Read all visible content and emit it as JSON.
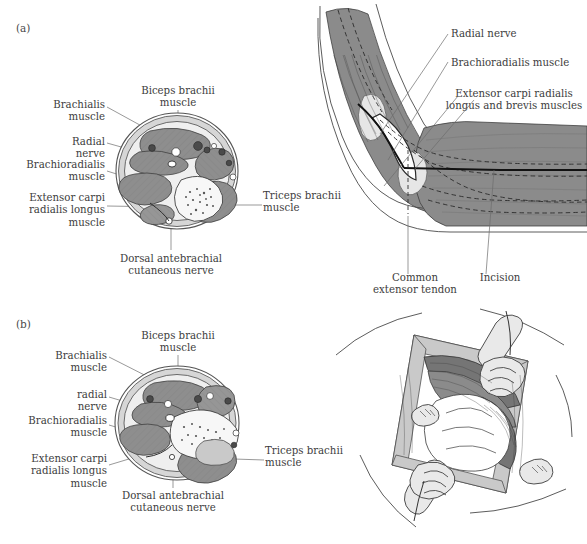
{
  "figure": {
    "background_color": "#ffffff",
    "text_color": "#3d3d3d",
    "muscle_color": "#8e8e8e",
    "fascia_color": "#d6d6d6",
    "bone_color": "#f7f7f7",
    "leader_color": "#6d6d6d",
    "incision_color": "#111111"
  },
  "panels": [
    {
      "letter": "(a)",
      "cross_section": {
        "caption_note": "Axial cross-section of the distal arm",
        "labels_left": [
          {
            "text": "Brachialis\nmuscle"
          },
          {
            "text": "Radial\nnerve"
          },
          {
            "text": "Brachioradialis\nmuscle"
          },
          {
            "text": "Extensor carpi\nradialis longus\nmuscle"
          }
        ],
        "labels_top": [
          {
            "text": "Biceps brachii\nmuscle"
          }
        ],
        "labels_right": [
          {
            "text": "Triceps brachii\nmuscle"
          }
        ],
        "labels_bottom": [
          {
            "text": "Dorsal antebrachial\ncutaneous nerve"
          }
        ]
      },
      "lateral_view": {
        "caption_note": "Lateral view of flexed elbow with planned incision",
        "labels_right": [
          {
            "text": "Radial nerve"
          },
          {
            "text": "Brachioradialis muscle"
          },
          {
            "text": "Extensor carpi radialis\nlongus and brevis muscles"
          }
        ],
        "labels_bottom": [
          {
            "text": "Common\nextensor tendon"
          },
          {
            "text": "Incision"
          }
        ]
      }
    },
    {
      "letter": "(b)",
      "cross_section": {
        "caption_note": "Axial cross-section showing the deep interval developed",
        "labels_left": [
          {
            "text": "Brachialis\nmuscle"
          },
          {
            "text": "radial\nnerve"
          },
          {
            "text": "Brachioradialis\nmuscle"
          },
          {
            "text": "Extensor carpi\nradialis longus\nmuscle"
          }
        ],
        "labels_top": [
          {
            "text": "Biceps brachii\nmuscle"
          }
        ],
        "labels_right": [
          {
            "text": "Triceps brachii\nmuscle"
          }
        ],
        "labels_bottom": [
          {
            "text": "Dorsal antebrachial\ncutaneous nerve"
          }
        ]
      },
      "operative_view": {
        "caption_note": "Operative exposure with retractors in place",
        "labels": []
      }
    }
  ]
}
